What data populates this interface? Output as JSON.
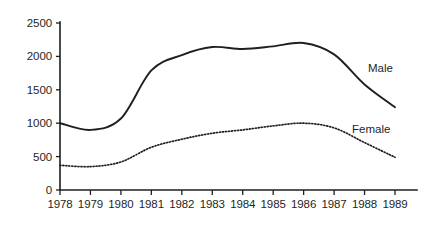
{
  "chart_data": {
    "type": "line",
    "title": "",
    "subtitle": "",
    "xlabel": "",
    "ylabel": "",
    "categories": [
      "1978",
      "1979",
      "1980",
      "1981",
      "1982",
      "1983",
      "1984",
      "1985",
      "1986",
      "1987",
      "1988",
      "1989"
    ],
    "x": [
      1978,
      1979,
      1980,
      1981,
      1982,
      1983,
      1984,
      1985,
      1986,
      1987,
      1988,
      1989
    ],
    "series": [
      {
        "name": "Male",
        "style": "solid",
        "values": [
          1000,
          900,
          1070,
          1790,
          2020,
          2140,
          2110,
          2150,
          2200,
          2030,
          1580,
          1240
        ]
      },
      {
        "name": "Female",
        "style": "dotted",
        "values": [
          370,
          350,
          420,
          640,
          760,
          850,
          900,
          960,
          1000,
          930,
          710,
          490
        ]
      }
    ],
    "ylim": [
      0,
      2500
    ],
    "yticks": [
      0,
      500,
      1000,
      1500,
      2000,
      2500
    ],
    "ytick_labels": [
      "0",
      "500",
      "1000",
      "1500",
      "2000",
      "2500"
    ],
    "xtick_labels": [
      "1978",
      "1979",
      "1980",
      "1981",
      "1982",
      "1983",
      "1984",
      "1985",
      "1986",
      "1987",
      "1988",
      "1989"
    ],
    "grid": false,
    "legend_position": "inline-right",
    "annotations": [
      {
        "text": "Male",
        "series": "Male"
      },
      {
        "text": "Female",
        "series": "Female"
      }
    ],
    "colors": {
      "axis": "#1f1f1f",
      "male_line": "#1f1f1f",
      "female_line": "#1f1f1f",
      "background": "#ffffff"
    }
  }
}
